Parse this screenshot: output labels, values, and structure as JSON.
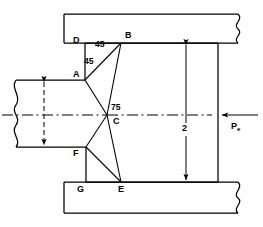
{
  "figure": {
    "type": "engineering-mechanical-diagram",
    "stroke_color": "#000000",
    "background_color": "#ffffff"
  },
  "points": {
    "A": {
      "label": "A",
      "x": 85,
      "y": 80
    },
    "B": {
      "label": "B",
      "x": 121,
      "y": 43
    },
    "C": {
      "label": "C",
      "x": 107,
      "y": 115
    },
    "D": {
      "label": "D",
      "x": 85,
      "y": 43
    },
    "E": {
      "label": "E",
      "x": 121,
      "y": 182
    },
    "F": {
      "label": "F",
      "x": 86,
      "y": 147
    },
    "G": {
      "label": "G",
      "x": 86,
      "y": 182
    }
  },
  "annotations": {
    "angle_upper": {
      "label": "45",
      "x": 99,
      "y": 44
    },
    "angle_lower": {
      "label": "45",
      "x": 88,
      "y": 60
    },
    "angle_center": {
      "label": "75",
      "x": 113,
      "y": 106
    },
    "dimension_vertical": {
      "label": "2",
      "x": 184,
      "y": 129
    },
    "force": {
      "label": "P",
      "subscript": "e",
      "x": 233,
      "y": 122
    }
  },
  "labels": {
    "A": "A",
    "B": "B",
    "C": "C",
    "D": "D",
    "E": "E",
    "F": "F",
    "G": "G"
  },
  "geometry": {
    "outer_block_left": 64,
    "outer_block_right": 218,
    "outer_top": 14,
    "outer_bottom": 213,
    "top_block_bottom": 43,
    "bottom_block_top": 182,
    "shaft_top": 80,
    "shaft_bottom": 147,
    "shaft_left": 16,
    "centerline_y": 115,
    "dimension_x": 186
  }
}
